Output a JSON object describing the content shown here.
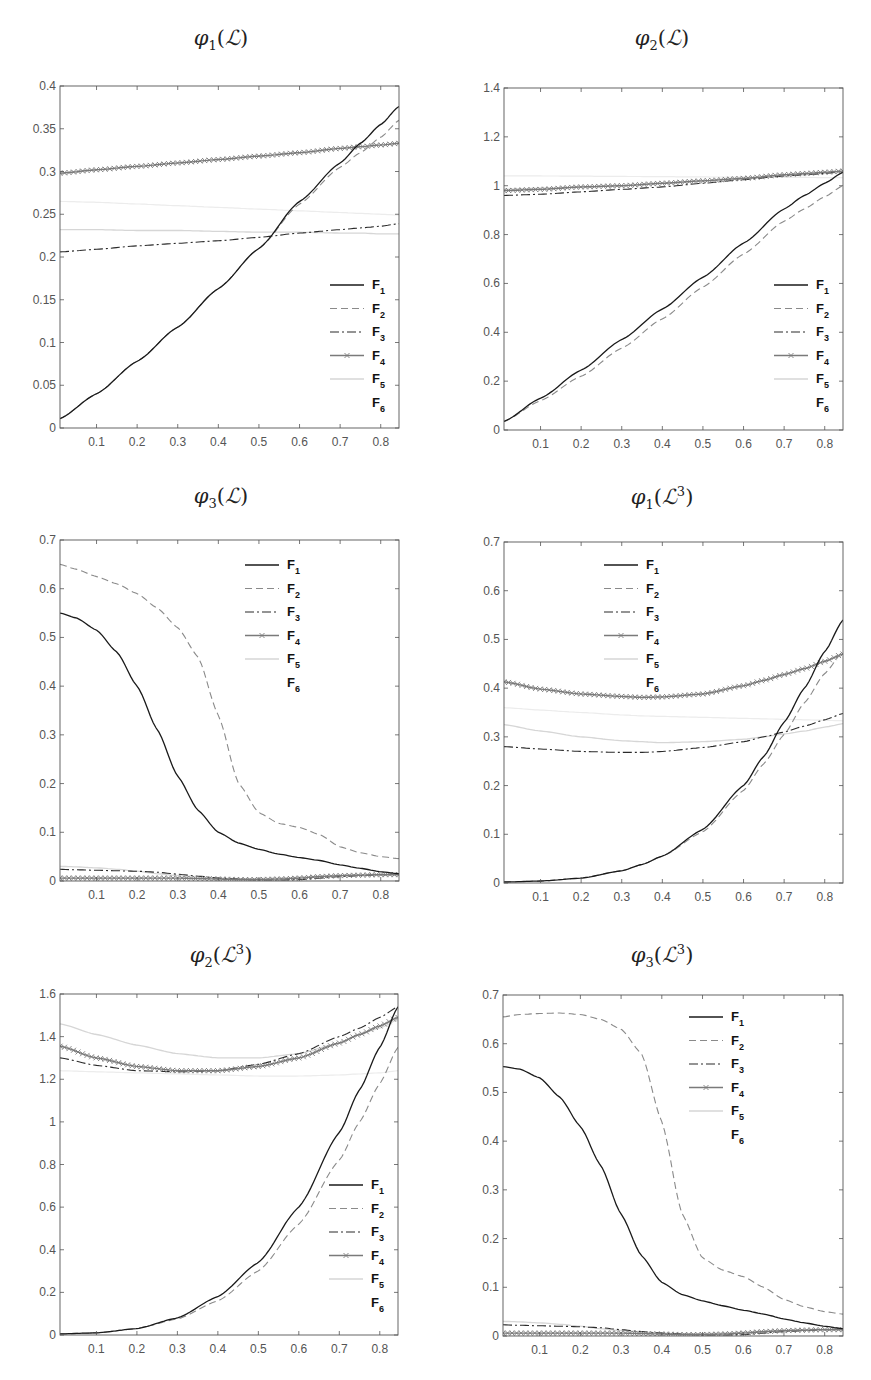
{
  "legend_labels": [
    "F1",
    "F2",
    "F3",
    "F4",
    "F5",
    "F6"
  ],
  "series_styles": [
    {
      "name": "F1",
      "color": "#1a1a1a",
      "dash": "",
      "width": 1.3,
      "marker": "none"
    },
    {
      "name": "F2",
      "color": "#8a8a8a",
      "dash": "7,4",
      "width": 1.1,
      "marker": "none"
    },
    {
      "name": "F3",
      "color": "#2a2a2a",
      "dash": "9,3,2,3",
      "width": 1.1,
      "marker": "none"
    },
    {
      "name": "F4",
      "color": "#7a7a7a",
      "dash": "",
      "width": 1.4,
      "marker": "x"
    },
    {
      "name": "F5",
      "color": "#d6d6d6",
      "dash": "",
      "width": 1.3,
      "marker": "none"
    },
    {
      "name": "F6",
      "color": "#ececec",
      "dash": "",
      "width": 1.2,
      "marker": "none"
    }
  ],
  "chart_data": [
    {
      "type": "line",
      "id": "phi1-L",
      "title": "φ1(L)",
      "title_parts": {
        "func": "φ",
        "sub": "1",
        "arg": "ℒ",
        "sup": ""
      },
      "xlim": [
        0.01,
        0.845
      ],
      "ylim": [
        0,
        0.4
      ],
      "xticks": [
        0.1,
        0.2,
        0.3,
        0.4,
        0.5,
        0.6,
        0.7,
        0.8
      ],
      "yticks": [
        0,
        0.05,
        0.1,
        0.15,
        0.2,
        0.25,
        0.3,
        0.35,
        0.4
      ],
      "ytick_labels": [
        "0",
        "0.05",
        "0.1",
        "0.15",
        "0.2",
        "0.25",
        "0.3",
        "0.35",
        "0.4"
      ],
      "frame": {
        "left": 60,
        "top": 86,
        "right": 399,
        "bottom": 428
      },
      "legend": {
        "x": 330,
        "y": 285
      },
      "title_pos": {
        "x": 221,
        "y": 26
      },
      "x": [
        0.01,
        0.1,
        0.2,
        0.3,
        0.4,
        0.5,
        0.6,
        0.7,
        0.75,
        0.8,
        0.845
      ],
      "series": [
        {
          "name": "F1",
          "values": [
            0.011,
            0.04,
            0.078,
            0.118,
            0.163,
            0.21,
            0.265,
            0.31,
            0.333,
            0.355,
            0.376
          ]
        },
        {
          "name": "F2",
          "values": [
            0.011,
            0.04,
            0.078,
            0.118,
            0.163,
            0.21,
            0.262,
            0.305,
            0.322,
            0.34,
            0.36
          ]
        },
        {
          "name": "F3",
          "values": [
            0.206,
            0.209,
            0.213,
            0.216,
            0.219,
            0.223,
            0.228,
            0.232,
            0.234,
            0.236,
            0.239
          ]
        },
        {
          "name": "F4",
          "values": [
            0.298,
            0.302,
            0.306,
            0.31,
            0.314,
            0.318,
            0.322,
            0.327,
            0.329,
            0.331,
            0.333
          ]
        },
        {
          "name": "F5",
          "values": [
            0.232,
            0.232,
            0.231,
            0.231,
            0.23,
            0.229,
            0.229,
            0.228,
            0.228,
            0.227,
            0.227
          ]
        },
        {
          "name": "F6",
          "values": [
            0.265,
            0.264,
            0.262,
            0.26,
            0.258,
            0.256,
            0.254,
            0.252,
            0.251,
            0.25,
            0.249
          ]
        }
      ]
    },
    {
      "type": "line",
      "id": "phi2-L",
      "title": "φ2(L)",
      "title_parts": {
        "func": "φ",
        "sub": "2",
        "arg": "ℒ",
        "sup": ""
      },
      "xlim": [
        0.01,
        0.845
      ],
      "ylim": [
        0,
        1.4
      ],
      "xticks": [
        0.1,
        0.2,
        0.3,
        0.4,
        0.5,
        0.6,
        0.7,
        0.8
      ],
      "yticks": [
        0,
        0.2,
        0.4,
        0.6,
        0.8,
        1,
        1.2,
        1.4
      ],
      "ytick_labels": [
        "0",
        "0.2",
        "0.4",
        "0.6",
        "0.8",
        "1",
        "1.2",
        "1.4"
      ],
      "frame": {
        "left": 504,
        "top": 88,
        "right": 843,
        "bottom": 430
      },
      "legend": {
        "x": 774,
        "y": 285
      },
      "title_pos": {
        "x": 662,
        "y": 26
      },
      "x": [
        0.01,
        0.1,
        0.2,
        0.3,
        0.4,
        0.5,
        0.6,
        0.7,
        0.75,
        0.8,
        0.845
      ],
      "series": [
        {
          "name": "F1",
          "values": [
            0.035,
            0.13,
            0.245,
            0.37,
            0.495,
            0.625,
            0.765,
            0.905,
            0.96,
            1.01,
            1.055
          ]
        },
        {
          "name": "F2",
          "values": [
            0.035,
            0.12,
            0.22,
            0.335,
            0.455,
            0.585,
            0.72,
            0.855,
            0.905,
            0.955,
            1.0
          ]
        },
        {
          "name": "F3",
          "values": [
            0.96,
            0.965,
            0.975,
            0.985,
            0.995,
            1.01,
            1.025,
            1.04,
            1.045,
            1.05,
            1.06
          ]
        },
        {
          "name": "F4",
          "values": [
            0.98,
            0.985,
            0.995,
            1.0,
            1.01,
            1.02,
            1.03,
            1.045,
            1.05,
            1.055,
            1.06
          ]
        },
        {
          "name": "F5",
          "values": [
            0.985,
            0.99,
            0.995,
            1.0,
            1.01,
            1.02,
            1.03,
            1.04,
            1.045,
            1.05,
            1.055
          ]
        },
        {
          "name": "F6",
          "values": [
            1.04,
            1.04,
            1.039,
            1.038,
            1.037,
            1.036,
            1.035,
            1.034,
            1.034,
            1.033,
            1.033
          ]
        }
      ]
    },
    {
      "type": "line",
      "id": "phi3-L",
      "title": "φ3(L)",
      "title_parts": {
        "func": "φ",
        "sub": "3",
        "arg": "ℒ",
        "sup": ""
      },
      "xlim": [
        0.01,
        0.845
      ],
      "ylim": [
        0,
        0.7
      ],
      "xticks": [
        0.1,
        0.2,
        0.3,
        0.4,
        0.5,
        0.6,
        0.7,
        0.8
      ],
      "yticks": [
        0,
        0.1,
        0.2,
        0.3,
        0.4,
        0.5,
        0.6,
        0.7
      ],
      "ytick_labels": [
        "0",
        "0.1",
        "0.2",
        "0.3",
        "0.4",
        "0.5",
        "0.6",
        "0.7"
      ],
      "frame": {
        "left": 60,
        "top": 540,
        "right": 399,
        "bottom": 881
      },
      "legend": {
        "x": 245,
        "y": 565
      },
      "title_pos": {
        "x": 221,
        "y": 484
      },
      "x": [
        0.01,
        0.05,
        0.1,
        0.15,
        0.2,
        0.25,
        0.3,
        0.35,
        0.4,
        0.45,
        0.5,
        0.55,
        0.6,
        0.65,
        0.7,
        0.75,
        0.8,
        0.845
      ],
      "series": [
        {
          "name": "F1",
          "values": [
            0.55,
            0.54,
            0.515,
            0.47,
            0.4,
            0.31,
            0.215,
            0.145,
            0.1,
            0.078,
            0.065,
            0.055,
            0.048,
            0.042,
            0.033,
            0.026,
            0.019,
            0.015
          ]
        },
        {
          "name": "F2",
          "values": [
            0.65,
            0.64,
            0.625,
            0.61,
            0.59,
            0.56,
            0.52,
            0.46,
            0.34,
            0.2,
            0.14,
            0.118,
            0.11,
            0.095,
            0.07,
            0.058,
            0.05,
            0.046
          ]
        },
        {
          "name": "F3",
          "values": [
            0.024,
            0.023,
            0.022,
            0.021,
            0.02,
            0.018,
            0.014,
            0.01,
            0.006,
            0.004,
            0.002,
            0.002,
            0.003,
            0.006,
            0.009,
            0.011,
            0.013,
            0.014
          ]
        },
        {
          "name": "F4",
          "values": [
            0.006,
            0.006,
            0.006,
            0.006,
            0.006,
            0.006,
            0.006,
            0.005,
            0.004,
            0.003,
            0.003,
            0.004,
            0.006,
            0.009,
            0.011,
            0.012,
            0.013,
            0.013
          ]
        },
        {
          "name": "F5",
          "values": [
            0.03,
            0.029,
            0.027,
            0.024,
            0.02,
            0.015,
            0.011,
            0.008,
            0.006,
            0.005,
            0.005,
            0.006,
            0.008,
            0.01,
            0.012,
            0.013,
            0.014,
            0.015
          ]
        },
        {
          "name": "F6",
          "values": [
            0.0,
            0.0,
            0.0,
            0.0,
            0.0,
            0.0,
            0.0,
            0.0,
            0.0,
            0.0,
            0.0,
            0.0,
            0.0,
            0.0,
            0.0,
            0.0,
            0.0,
            0.0
          ]
        }
      ]
    },
    {
      "type": "line",
      "id": "phi1-L3",
      "title": "φ1(L^3)",
      "title_parts": {
        "func": "φ",
        "sub": "1",
        "arg": "ℒ",
        "sup": "3"
      },
      "xlim": [
        0.01,
        0.845
      ],
      "ylim": [
        0,
        0.7
      ],
      "xticks": [
        0.1,
        0.2,
        0.3,
        0.4,
        0.5,
        0.6,
        0.7,
        0.8
      ],
      "yticks": [
        0,
        0.1,
        0.2,
        0.3,
        0.4,
        0.5,
        0.6,
        0.7
      ],
      "ytick_labels": [
        "0",
        "0.1",
        "0.2",
        "0.3",
        "0.4",
        "0.5",
        "0.6",
        "0.7"
      ],
      "frame": {
        "left": 504,
        "top": 542,
        "right": 843,
        "bottom": 883
      },
      "legend": {
        "x": 604,
        "y": 565
      },
      "title_pos": {
        "x": 662,
        "y": 484
      },
      "x": [
        0.01,
        0.1,
        0.2,
        0.3,
        0.35,
        0.4,
        0.5,
        0.6,
        0.65,
        0.7,
        0.75,
        0.8,
        0.845
      ],
      "series": [
        {
          "name": "F1",
          "values": [
            0.002,
            0.004,
            0.01,
            0.025,
            0.038,
            0.055,
            0.11,
            0.2,
            0.26,
            0.33,
            0.4,
            0.475,
            0.54
          ]
        },
        {
          "name": "F2",
          "values": [
            0.002,
            0.004,
            0.01,
            0.025,
            0.038,
            0.055,
            0.105,
            0.19,
            0.245,
            0.305,
            0.37,
            0.43,
            0.475
          ]
        },
        {
          "name": "F3",
          "values": [
            0.28,
            0.275,
            0.27,
            0.268,
            0.268,
            0.27,
            0.278,
            0.29,
            0.3,
            0.31,
            0.322,
            0.335,
            0.348
          ]
        },
        {
          "name": "F4",
          "values": [
            0.413,
            0.398,
            0.388,
            0.383,
            0.381,
            0.382,
            0.388,
            0.405,
            0.416,
            0.428,
            0.44,
            0.455,
            0.47
          ]
        },
        {
          "name": "F5",
          "values": [
            0.325,
            0.312,
            0.3,
            0.292,
            0.29,
            0.288,
            0.29,
            0.295,
            0.3,
            0.306,
            0.312,
            0.32,
            0.327
          ]
        },
        {
          "name": "F6",
          "values": [
            0.36,
            0.355,
            0.35,
            0.345,
            0.343,
            0.342,
            0.34,
            0.338,
            0.337,
            0.336,
            0.335,
            0.334,
            0.333
          ]
        }
      ]
    },
    {
      "type": "line",
      "id": "phi2-L3",
      "title": "φ2(L^3)",
      "title_parts": {
        "func": "φ",
        "sub": "2",
        "arg": "ℒ",
        "sup": "3"
      },
      "xlim": [
        0.01,
        0.845
      ],
      "ylim": [
        0,
        1.6
      ],
      "xticks": [
        0.1,
        0.2,
        0.3,
        0.4,
        0.5,
        0.6,
        0.7,
        0.8
      ],
      "yticks": [
        0,
        0.2,
        0.4,
        0.6,
        0.8,
        1,
        1.2,
        1.4,
        1.6
      ],
      "ytick_labels": [
        "0",
        "0.2",
        "0.4",
        "0.6",
        "0.8",
        "1",
        "1.2",
        "1.4",
        "1.6"
      ],
      "frame": {
        "left": 60,
        "top": 994,
        "right": 398,
        "bottom": 1335
      },
      "legend": {
        "x": 329,
        "y": 1185
      },
      "title_pos": {
        "x": 221,
        "y": 942
      },
      "x": [
        0.01,
        0.1,
        0.2,
        0.3,
        0.4,
        0.5,
        0.6,
        0.7,
        0.75,
        0.8,
        0.845
      ],
      "series": [
        {
          "name": "F1",
          "values": [
            0.005,
            0.01,
            0.03,
            0.08,
            0.18,
            0.34,
            0.6,
            0.95,
            1.15,
            1.35,
            1.54
          ]
        },
        {
          "name": "F2",
          "values": [
            0.005,
            0.01,
            0.03,
            0.075,
            0.16,
            0.3,
            0.52,
            0.82,
            1.0,
            1.18,
            1.35
          ]
        },
        {
          "name": "F3",
          "values": [
            1.3,
            1.265,
            1.24,
            1.235,
            1.24,
            1.27,
            1.32,
            1.4,
            1.44,
            1.49,
            1.54
          ]
        },
        {
          "name": "F4",
          "values": [
            1.355,
            1.3,
            1.26,
            1.24,
            1.24,
            1.26,
            1.3,
            1.37,
            1.41,
            1.45,
            1.49
          ]
        },
        {
          "name": "F5",
          "values": [
            1.46,
            1.41,
            1.36,
            1.32,
            1.3,
            1.3,
            1.32,
            1.37,
            1.41,
            1.44,
            1.48
          ]
        },
        {
          "name": "F6",
          "values": [
            1.24,
            1.235,
            1.23,
            1.225,
            1.22,
            1.215,
            1.215,
            1.22,
            1.225,
            1.23,
            1.24
          ]
        }
      ]
    },
    {
      "type": "line",
      "id": "phi3-L3",
      "title": "φ3(L^3)",
      "title_parts": {
        "func": "φ",
        "sub": "3",
        "arg": "ℒ",
        "sup": "3"
      },
      "xlim": [
        0.01,
        0.845
      ],
      "ylim": [
        0,
        0.7
      ],
      "xticks": [
        0.1,
        0.2,
        0.3,
        0.4,
        0.5,
        0.6,
        0.7,
        0.8
      ],
      "yticks": [
        0,
        0.1,
        0.2,
        0.3,
        0.4,
        0.5,
        0.6,
        0.7
      ],
      "ytick_labels": [
        "0",
        "0.1",
        "0.2",
        "0.3",
        "0.4",
        "0.5",
        "0.6",
        "0.7"
      ],
      "frame": {
        "left": 503,
        "top": 995,
        "right": 843,
        "bottom": 1336
      },
      "legend": {
        "x": 689,
        "y": 1017
      },
      "title_pos": {
        "x": 662,
        "y": 942
      },
      "x": [
        0.01,
        0.05,
        0.1,
        0.15,
        0.2,
        0.25,
        0.3,
        0.35,
        0.4,
        0.45,
        0.5,
        0.55,
        0.6,
        0.65,
        0.7,
        0.75,
        0.8,
        0.845
      ],
      "series": [
        {
          "name": "F1",
          "values": [
            0.553,
            0.548,
            0.53,
            0.49,
            0.43,
            0.35,
            0.25,
            0.165,
            0.11,
            0.085,
            0.072,
            0.062,
            0.053,
            0.045,
            0.035,
            0.027,
            0.02,
            0.015
          ]
        },
        {
          "name": "F2",
          "values": [
            0.655,
            0.66,
            0.662,
            0.663,
            0.66,
            0.65,
            0.63,
            0.58,
            0.44,
            0.25,
            0.16,
            0.135,
            0.122,
            0.1,
            0.075,
            0.06,
            0.05,
            0.045
          ]
        },
        {
          "name": "F3",
          "values": [
            0.023,
            0.022,
            0.021,
            0.02,
            0.019,
            0.017,
            0.013,
            0.009,
            0.006,
            0.004,
            0.002,
            0.002,
            0.003,
            0.006,
            0.009,
            0.011,
            0.013,
            0.014
          ]
        },
        {
          "name": "F4",
          "values": [
            0.006,
            0.006,
            0.006,
            0.006,
            0.006,
            0.006,
            0.006,
            0.005,
            0.004,
            0.003,
            0.003,
            0.004,
            0.006,
            0.009,
            0.011,
            0.012,
            0.013,
            0.013
          ]
        },
        {
          "name": "F5",
          "values": [
            0.03,
            0.029,
            0.027,
            0.024,
            0.02,
            0.015,
            0.011,
            0.008,
            0.006,
            0.005,
            0.005,
            0.006,
            0.008,
            0.01,
            0.012,
            0.013,
            0.014,
            0.015
          ]
        },
        {
          "name": "F6",
          "values": [
            0.0,
            0.0,
            0.0,
            0.0,
            0.0,
            0.0,
            0.0,
            0.0,
            0.0,
            0.0,
            0.0,
            0.0,
            0.0,
            0.0,
            0.0,
            0.0,
            0.0,
            0.0
          ]
        }
      ]
    }
  ]
}
